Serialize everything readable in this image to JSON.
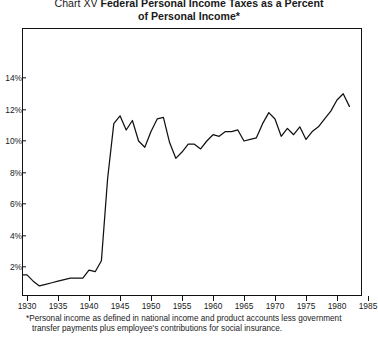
{
  "title": {
    "label": "Chart XV",
    "main_line1": "Federal Personal Income Taxes as a Percent",
    "main_line2": "of Personal Income*"
  },
  "footnote": {
    "line1": "*Personal income as defined in national income and product accounts less government",
    "line2": "transfer payments plus employee's contributions for social insurance."
  },
  "colors": {
    "line": "#111111",
    "axis": "#111111",
    "background": "#ffffff"
  },
  "chart_data": {
    "type": "line",
    "title": "Chart XV Federal Personal Income Taxes as a Percent of Personal Income*",
    "xlabel": "",
    "ylabel": "",
    "xlim": [
      1929,
      1985
    ],
    "ylim": [
      0,
      15
    ],
    "grid": false,
    "legend": false,
    "xticks": [
      1930,
      1935,
      1940,
      1945,
      1950,
      1955,
      1960,
      1965,
      1970,
      1975,
      1980,
      1985
    ],
    "xtick_labels": [
      "1930",
      "1935",
      "1940",
      "1945",
      "1950",
      "1955",
      "1960",
      "1965",
      "1970",
      "1975",
      "1980",
      "1985"
    ],
    "yticks": [
      2,
      4,
      6,
      8,
      10,
      12,
      14
    ],
    "ytick_labels": [
      "2%",
      "4%",
      "6%",
      "8%",
      "10%",
      "12%",
      "14%"
    ],
    "series": [
      {
        "name": "Federal personal income taxes as a percent of personal income",
        "x": [
          1929,
          1930,
          1931,
          1932,
          1933,
          1934,
          1935,
          1936,
          1937,
          1938,
          1939,
          1940,
          1941,
          1942,
          1943,
          1944,
          1945,
          1946,
          1947,
          1948,
          1949,
          1950,
          1951,
          1952,
          1953,
          1954,
          1955,
          1956,
          1957,
          1958,
          1959,
          1960,
          1961,
          1962,
          1963,
          1964,
          1965,
          1966,
          1967,
          1968,
          1969,
          1970,
          1971,
          1972,
          1973,
          1974,
          1975,
          1976,
          1977,
          1978,
          1979,
          1980,
          1981,
          1982
        ],
        "y": [
          1.5,
          1.5,
          1.1,
          0.8,
          0.9,
          1.0,
          1.1,
          1.2,
          1.3,
          1.3,
          1.3,
          1.8,
          1.7,
          2.4,
          7.6,
          11.1,
          11.6,
          10.7,
          11.3,
          10.0,
          9.6,
          10.6,
          11.4,
          11.5,
          9.9,
          8.9,
          9.3,
          9.8,
          9.8,
          9.5,
          10.0,
          10.4,
          10.3,
          10.6,
          10.6,
          10.7,
          10.0,
          10.1,
          10.2,
          11.1,
          11.8,
          11.4,
          10.3,
          10.8,
          10.4,
          10.9,
          10.1,
          10.6,
          10.9,
          11.4,
          11.9,
          12.6,
          13.0,
          12.2
        ]
      }
    ]
  }
}
